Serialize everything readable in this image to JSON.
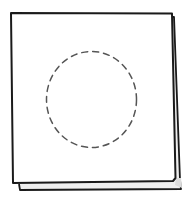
{
  "illustration": {
    "subject": "sketch of stacked pages with dashed circle",
    "colors": {
      "stroke": "#1a1a1a",
      "dashed_circle": "#555555",
      "shadow_fill": "#e6e6e6",
      "background": "#ffffff"
    }
  }
}
